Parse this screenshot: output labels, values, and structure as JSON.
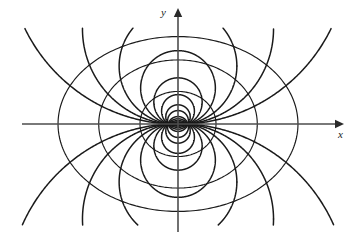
{
  "figure": {
    "title": "",
    "caption": "",
    "background_color": "#ffffff",
    "curve_color": "#1a1a1a",
    "axis_color": "#4d4d4d"
  },
  "axes": {
    "x_label": "x",
    "y_label": "y",
    "x_axis": {
      "x_start": 22,
      "x_end": 344,
      "y": 124,
      "arrow": "right"
    },
    "y_axis": {
      "y_start": 8,
      "y_end": 232,
      "x": 178,
      "arrow": "up"
    }
  },
  "chart_data": {
    "type": "line",
    "title": "",
    "subtitle": "",
    "xlabel": "x",
    "ylabel": "y",
    "grid": false,
    "legend": null,
    "origin_px": {
      "x": 178,
      "y": 124
    },
    "focus_px": {
      "left_x": 168,
      "right_x": 188,
      "y": 124
    },
    "focus_half_separation_px": 10,
    "xlim": [
      -160,
      170
    ],
    "ylim": [
      -110,
      118
    ],
    "equipotential_curves": {
      "count": 3,
      "name": "ellipse-like closed curves",
      "x_semi_axes_px": [
        40,
        82,
        122
      ],
      "y_semi_axes_px": [
        31,
        62,
        86
      ],
      "x_axis_crossings_right_px": [
        218,
        260,
        300
      ],
      "x_axis_crossings_left_px": [
        138,
        96,
        56
      ],
      "y_axis_crossings_top_px": [
        93,
        62,
        38
      ],
      "y_axis_crossings_bottom_px": [
        155,
        186,
        210
      ]
    },
    "field_line_curves": {
      "count": 16,
      "name": "curves through the two foci",
      "upper_left_top_endpoints_px": [
        50,
        85,
        110,
        128,
        142
      ],
      "upper_right_top_endpoints_px": [
        214,
        232,
        254,
        284,
        306
      ]
    }
  },
  "elements": {
    "x_arrowhead": "arrow-right",
    "y_arrowhead": "arrow-up"
  }
}
